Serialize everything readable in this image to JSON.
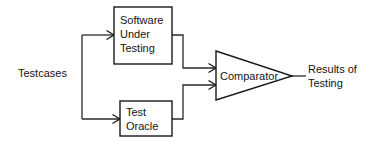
{
  "diagram": {
    "background_color": "#ffffff",
    "line_color": "#1a1a1a",
    "text_color": "#141414",
    "nodes": {
      "testcases": {
        "label": "Testcases",
        "shape": "text"
      },
      "software_under_testing": {
        "shape": "rectangle",
        "line1": "Software",
        "line2": "Under",
        "line3": "Testing"
      },
      "test_oracle": {
        "shape": "rectangle",
        "line1": "Test",
        "line2": "Oracle"
      },
      "comparator": {
        "shape": "triangle",
        "label": "Comparator"
      },
      "results": {
        "shape": "text",
        "line1": "Results of",
        "line2": "Testing"
      }
    },
    "edges": [
      {
        "name": "testcases-to-software-under-testing",
        "from": "testcases",
        "to": "software_under_testing",
        "arrow": true
      },
      {
        "name": "testcases-to-test-oracle",
        "from": "testcases",
        "to": "test_oracle",
        "arrow": true
      },
      {
        "name": "software-under-testing-to-comparator",
        "from": "software_under_testing",
        "to": "comparator",
        "arrow": true
      },
      {
        "name": "test-oracle-to-comparator",
        "from": "test_oracle",
        "to": "comparator",
        "arrow": true
      },
      {
        "name": "comparator-to-results",
        "from": "comparator",
        "to": "results",
        "arrow": false
      }
    ]
  }
}
